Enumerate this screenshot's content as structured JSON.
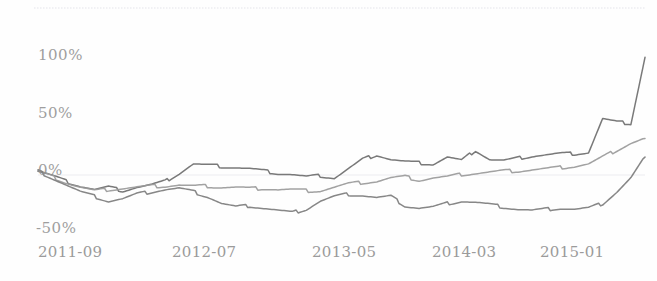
{
  "chart_data": {
    "type": "line",
    "title": "",
    "subtitle": "",
    "xlabel": "",
    "ylabel": "",
    "ylim": [
      -62,
      115
    ],
    "xlim": [
      0,
      43
    ],
    "grid": "faint horizontal gridlines at top border and 0%",
    "legend": "none",
    "y_ticks": [
      "100%",
      "50%",
      "0%",
      "-50%"
    ],
    "y_tick_values": [
      100,
      50,
      0,
      -50
    ],
    "x_ticks": [
      "2011-09",
      "2012-07",
      "2013-05",
      "2014-03",
      "2015-01"
    ],
    "x_tick_indices": [
      0,
      10,
      20,
      30,
      40
    ],
    "x": [
      0,
      1,
      2,
      3,
      4,
      5,
      6,
      7,
      8,
      9,
      10,
      11,
      12,
      13,
      14,
      15,
      16,
      17,
      18,
      19,
      20,
      21,
      22,
      23,
      24,
      25,
      26,
      27,
      28,
      29,
      30,
      31,
      32,
      33,
      34,
      35,
      36,
      37,
      38,
      39,
      40,
      41,
      42,
      43
    ],
    "series": [
      {
        "name": "series-1",
        "color": "#6e6e6e",
        "values": [
          0,
          -4,
          -9,
          -13,
          -16,
          -14,
          -17,
          -14,
          -12,
          -9,
          -2,
          6,
          5,
          4,
          3,
          2,
          0,
          -2,
          -3,
          -5,
          -4,
          -6,
          2,
          10,
          14,
          10,
          8,
          7,
          6,
          12,
          9,
          18,
          10,
          9,
          11,
          13,
          14,
          15,
          15,
          16,
          45,
          42,
          41,
          98
        ]
      },
      {
        "name": "series-2",
        "color": "#9a9a9a",
        "values": [
          0,
          -5,
          -10,
          -14,
          -17,
          -16,
          -15,
          -14,
          -13,
          -13,
          -12,
          -13,
          -13,
          -14,
          -14,
          -15,
          -15,
          -16,
          -16,
          -17,
          -17,
          -14,
          -11,
          -10,
          -9,
          -6,
          -5,
          -8,
          -6,
          -5,
          -3,
          -2,
          -1,
          0,
          0,
          1,
          2,
          3,
          4,
          6,
          12,
          18,
          24,
          28
        ]
      },
      {
        "name": "series-3",
        "color": "#7d7d7d",
        "values": [
          0,
          -6,
          -12,
          -18,
          -22,
          -26,
          -24,
          -20,
          -18,
          -16,
          -15,
          -18,
          -22,
          -28,
          -31,
          -30,
          -32,
          -34,
          -36,
          -33,
          -26,
          -22,
          -20,
          -21,
          -23,
          -22,
          -30,
          -32,
          -31,
          -28,
          -26,
          -27,
          -29,
          -31,
          -33,
          -34,
          -33,
          -32,
          -33,
          -32,
          -28,
          -18,
          -6,
          12
        ]
      }
    ],
    "annotations": [
      "top series spikes sharply near 2014-11 to about 45% then jumps to about 100% near the right edge with a dip-and-rebound",
      "all three series start at 0% at 2011-09",
      "image appears scanned/faded with light gray line art"
    ]
  },
  "axis": {
    "y_labels": [
      {
        "text": "100%",
        "y_px": 46
      },
      {
        "text": "50%",
        "y_px": 104
      },
      {
        "text": "0%",
        "y_px": 161
      },
      {
        "text": "-50%",
        "y_px": 219
      }
    ],
    "x_labels": [
      {
        "text": "2011-09",
        "x_px": 38
      },
      {
        "text": "2012-07",
        "x_px": 172
      },
      {
        "text": "2013-05",
        "x_px": 312
      },
      {
        "text": "2014-03",
        "x_px": 432
      },
      {
        "text": "2015-01",
        "x_px": 540
      }
    ]
  },
  "style": {
    "background": "#fefefe",
    "gridline_color": "#e8e8ec",
    "tick_text_color": "#8c8c8c"
  }
}
